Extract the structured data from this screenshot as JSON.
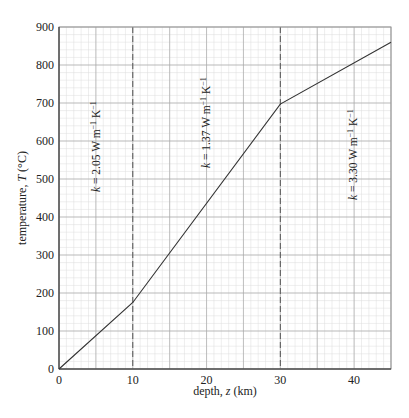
{
  "chart_data": {
    "type": "line",
    "title": "",
    "xlabel": "depth, z (km)",
    "ylabel": "temperature, T (°C)",
    "xlim": [
      0,
      45
    ],
    "ylim": [
      0,
      900
    ],
    "x_ticks": [
      0,
      10,
      20,
      30,
      40
    ],
    "y_ticks": [
      0,
      100,
      200,
      300,
      400,
      500,
      600,
      700,
      800,
      900
    ],
    "grid": true,
    "series": [
      {
        "name": "geotherm",
        "x": [
          0,
          10,
          30,
          45
        ],
        "y": [
          0,
          175,
          697,
          860
        ]
      }
    ],
    "vertical_lines": [
      {
        "x": 10,
        "style": "dashed"
      },
      {
        "x": 30,
        "style": "dashed"
      }
    ],
    "annotations": [
      {
        "text": "k = 2.05 W m⁻¹ K⁻¹",
        "x": 1.5,
        "y": 600,
        "rotation": -90
      },
      {
        "text": "k = 1.37 W m⁻¹ K⁻¹",
        "x": 20,
        "y": 700,
        "rotation": -90
      },
      {
        "text": "k = 3.30 W m⁻¹ K⁻¹",
        "x": 40,
        "y": 600,
        "rotation": -90
      }
    ]
  },
  "labels": {
    "xlabel_prefix": "depth, ",
    "xlabel_var": "z",
    "xlabel_suffix": " (km)",
    "ylabel_prefix": "temperature, ",
    "ylabel_var": "T",
    "ylabel_suffix": " (°C)",
    "k_prefix": "k",
    "ann1": " = 2.05 W m",
    "ann2": " = 1.37 W m",
    "ann3": " = 3.30 W m",
    "unit_exp": "−1",
    "unit_k": " K"
  }
}
